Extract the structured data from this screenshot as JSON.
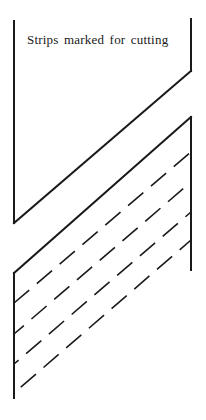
{
  "diagram": {
    "caption": "Strips marked for cutting",
    "stroke_color": "#1a1a1a",
    "upper_piece": {
      "left_edge": {
        "x": 14,
        "y1": 21,
        "y2": 223
      },
      "right_edge": {
        "x": 191,
        "y1": 19,
        "y2": 71
      },
      "diagonal_cut": {
        "x1": 14,
        "y1": 223,
        "x2": 191,
        "y2": 71
      }
    },
    "lower_piece": {
      "left_edge": {
        "x": 14,
        "y1": 273,
        "y2": 398
      },
      "right_edge": {
        "x": 191,
        "y1": 117,
        "y2": 270
      },
      "diagonal_edge": {
        "x1": 14,
        "y1": 273,
        "x2": 191,
        "y2": 117
      },
      "cutting_lines": [
        {
          "x1": 14,
          "y1": 303,
          "x2": 191,
          "y2": 152
        },
        {
          "x1": 14,
          "y1": 334,
          "x2": 191,
          "y2": 182
        },
        {
          "x1": 14,
          "y1": 364,
          "x2": 191,
          "y2": 212
        },
        {
          "x1": 14,
          "y1": 393,
          "x2": 191,
          "y2": 240
        }
      ]
    }
  }
}
